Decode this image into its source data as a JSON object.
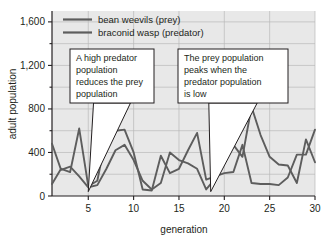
{
  "chart_data": {
    "type": "line",
    "title": "",
    "xlabel": "generation",
    "ylabel": "adult population",
    "xlim": [
      1,
      30
    ],
    "ylim": [
      0,
      1700
    ],
    "xticks": [
      "5",
      "10",
      "15",
      "20",
      "25",
      "30"
    ],
    "xtick_values": [
      5,
      10,
      15,
      20,
      25,
      30
    ],
    "yticks": [
      "0",
      "400",
      "800",
      "1,200",
      "1,600"
    ],
    "ytick_values": [
      0,
      400,
      800,
      1200,
      1600
    ],
    "yminor_values": [
      200,
      600,
      1000,
      1400
    ],
    "grid": true,
    "legend_position": "top-left",
    "series": [
      {
        "name": "bean weevils (prey)",
        "color": "#5d5d5d",
        "x": [
          1,
          2,
          3,
          4,
          5,
          6,
          7,
          8,
          9,
          10,
          11,
          12,
          13,
          14,
          15,
          16,
          17,
          18,
          19,
          20,
          21,
          22,
          23,
          24,
          25,
          26,
          27,
          28,
          29,
          30
        ],
        "values": [
          480,
          240,
          270,
          180,
          80,
          100,
          250,
          420,
          470,
          330,
          140,
          60,
          120,
          400,
          330,
          300,
          250,
          60,
          160,
          530,
          470,
          360,
          820,
          560,
          360,
          290,
          280,
          120,
          520,
          310
        ]
      },
      {
        "name": "braconid wasp (predator)",
        "color": "#5d5d5d",
        "x": [
          1,
          2,
          3,
          4,
          5,
          6,
          7,
          8,
          9,
          10,
          11,
          12,
          13,
          14,
          15,
          16,
          17,
          18,
          19,
          20,
          21,
          22,
          23,
          24,
          25,
          26,
          27,
          28,
          29,
          30
        ],
        "values": [
          110,
          250,
          220,
          620,
          90,
          140,
          560,
          600,
          610,
          400,
          60,
          50,
          370,
          210,
          250,
          420,
          580,
          150,
          180,
          210,
          220,
          470,
          120,
          110,
          110,
          100,
          170,
          380,
          380,
          610
        ]
      }
    ],
    "annotations": [
      {
        "id": "annotation-predator",
        "text_lines": [
          "A high predator",
          "population",
          "reduces the prey",
          "population"
        ],
        "pointer_target_x": 5,
        "pointer_target_y": 40
      },
      {
        "id": "annotation-prey",
        "text_lines": [
          "The prey population",
          "peaks when the",
          "predator population",
          "is low"
        ],
        "pointer_target_x": 18.5,
        "pointer_target_y": 40
      }
    ],
    "colors": {
      "plot_background": "#e8e8e8",
      "grid": "#b8b8b8",
      "axis": "#231f20",
      "series_line": "#5d5d5d",
      "annotation_box": "#ffffff",
      "annotation_border": "#231f20",
      "text": "#231f20"
    }
  },
  "legend": {
    "items": [
      {
        "label": "bean weevils (prey)"
      },
      {
        "label": "braconid wasp (predator)"
      }
    ]
  },
  "axes": {
    "y_title": "adult population",
    "x_title": "generation",
    "y_tick_labels": [
      "1,600",
      "1,200",
      "800",
      "400",
      "0"
    ],
    "x_tick_labels": [
      "5",
      "10",
      "15",
      "20",
      "25",
      "30"
    ]
  },
  "annotations": {
    "left": {
      "line1": "A high predator",
      "line2": "population",
      "line3": "reduces the prey",
      "line4": "population"
    },
    "right": {
      "line1": "The prey population",
      "line2": "peaks when the",
      "line3": "predator population",
      "line4": "is low"
    }
  }
}
